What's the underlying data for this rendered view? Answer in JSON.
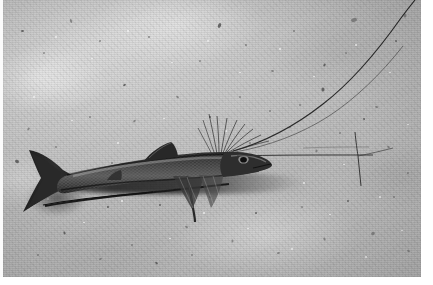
{
  "image": {
    "kind": "photograph",
    "medium": "black-and-white underwater photograph",
    "title": "Tripodfish resting on deep-sea sediment",
    "caption": "A slender tripodfish stands on the seafloor, propped on elongated pelvic and lower caudal fin rays, with long pectoral fin filaments trailing forward across the sediment.",
    "orientation": "landscape",
    "palette": {
      "sediment_light": "#d6d6d4",
      "sediment_mid": "#c2c2bf",
      "sediment_dark": "#a9a9a5",
      "fish_body": "#3a3a37",
      "fish_dark": "#1d1d1b",
      "shadow": "#2a2a28",
      "border": "#ffffff",
      "speck_dark": "#5a5a56",
      "speck_light": "#f2f2ef"
    },
    "subjects": [
      {
        "name": "tripodfish",
        "label": "Tripodfish (Bathypterois) on seabed",
        "position": "center-left, body horizontal"
      },
      {
        "name": "caudal-fin",
        "label": "Forked caudal fin",
        "position": "far left"
      },
      {
        "name": "caudal-filament",
        "label": "Elongated lower caudal fin ray acting as a strut",
        "position": "lower left, trailing right"
      },
      {
        "name": "dorsal-fin",
        "label": "Dorsal fin",
        "position": "upper mid-body"
      },
      {
        "name": "pelvic-strut",
        "label": "Elongated pelvic fin ray propping the body",
        "position": "beneath mid-body"
      },
      {
        "name": "pectoral-filaments",
        "label": "Long pectoral fin filaments fanning forward",
        "position": "from behind head, sweeping up and right"
      },
      {
        "name": "eye",
        "label": "Small dark eye",
        "position": "head, right of body"
      },
      {
        "name": "snout",
        "label": "Pointed snout",
        "position": "rightmost point of the fish"
      },
      {
        "name": "body-shadow",
        "label": "Shadow cast on the sediment",
        "position": "directly below the body"
      },
      {
        "name": "sediment",
        "label": "Fine pale seafloor sediment with scattered dark debris",
        "position": "full frame background"
      }
    ],
    "specks_dark": [
      [
        18,
        30,
        3,
        2
      ],
      [
        40,
        52,
        2,
        2
      ],
      [
        66,
        20,
        4,
        2
      ],
      [
        96,
        40,
        2,
        2
      ],
      [
        120,
        84,
        3,
        2
      ],
      [
        145,
        36,
        2,
        2
      ],
      [
        173,
        96,
        3,
        2
      ],
      [
        196,
        60,
        2,
        2
      ],
      [
        214,
        24,
        5,
        3
      ],
      [
        242,
        44,
        2,
        2
      ],
      [
        268,
        70,
        3,
        2
      ],
      [
        290,
        30,
        2,
        2
      ],
      [
        318,
        88,
        4,
        3
      ],
      [
        342,
        52,
        2,
        2
      ],
      [
        348,
        18,
        6,
        4
      ],
      [
        372,
        106,
        3,
        2
      ],
      [
        392,
        40,
        2,
        2
      ],
      [
        400,
        14,
        4,
        3
      ],
      [
        24,
        128,
        3,
        2
      ],
      [
        52,
        146,
        2,
        2
      ],
      [
        12,
        160,
        4,
        3
      ],
      [
        86,
        116,
        2,
        2
      ],
      [
        108,
        162,
        2,
        2
      ],
      [
        130,
        120,
        3,
        2
      ],
      [
        156,
        204,
        2,
        2
      ],
      [
        182,
        226,
        3,
        2
      ],
      [
        206,
        196,
        2,
        2
      ],
      [
        228,
        240,
        3,
        2
      ],
      [
        252,
        212,
        2,
        2
      ],
      [
        274,
        252,
        3,
        2
      ],
      [
        298,
        206,
        2,
        2
      ],
      [
        320,
        238,
        3,
        2
      ],
      [
        344,
        200,
        2,
        2
      ],
      [
        368,
        232,
        4,
        3
      ],
      [
        390,
        196,
        2,
        2
      ],
      [
        404,
        250,
        3,
        2
      ],
      [
        60,
        232,
        3,
        2
      ],
      [
        34,
        254,
        2,
        2
      ],
      [
        96,
        258,
        3,
        2
      ],
      [
        128,
        244,
        2,
        2
      ],
      [
        152,
        262,
        3,
        2
      ],
      [
        188,
        254,
        2,
        2
      ],
      [
        312,
        150,
        3,
        2
      ],
      [
        336,
        132,
        2,
        2
      ],
      [
        360,
        118,
        2,
        2
      ],
      [
        384,
        146,
        3,
        2
      ],
      [
        404,
        172,
        2,
        2
      ],
      [
        70,
        186,
        2,
        2
      ],
      [
        104,
        206,
        2,
        2
      ],
      [
        144,
        176,
        2,
        2
      ],
      [
        246,
        142,
        2,
        2
      ],
      [
        286,
        126,
        2,
        2
      ],
      [
        320,
        64,
        3,
        2
      ],
      [
        296,
        104,
        2,
        2
      ],
      [
        266,
        110,
        2,
        2
      ],
      [
        236,
        96,
        2,
        2
      ],
      [
        206,
        116,
        2,
        2
      ]
    ],
    "specks_light": [
      [
        52,
        36,
        2,
        2
      ],
      [
        88,
        58,
        2,
        1
      ],
      [
        124,
        30,
        2,
        2
      ],
      [
        168,
        62,
        2,
        1
      ],
      [
        204,
        40,
        2,
        2
      ],
      [
        236,
        72,
        2,
        1
      ],
      [
        276,
        48,
        2,
        2
      ],
      [
        310,
        76,
        2,
        1
      ],
      [
        352,
        44,
        2,
        2
      ],
      [
        386,
        72,
        2,
        1
      ],
      [
        30,
        96,
        2,
        2
      ],
      [
        68,
        120,
        2,
        1
      ],
      [
        114,
        142,
        2,
        2
      ],
      [
        160,
        118,
        2,
        1
      ],
      [
        222,
        130,
        2,
        2
      ],
      [
        258,
        158,
        2,
        1
      ],
      [
        300,
        182,
        2,
        2
      ],
      [
        340,
        164,
        2,
        1
      ],
      [
        376,
        196,
        2,
        2
      ],
      [
        404,
        124,
        2,
        1
      ],
      [
        44,
        198,
        2,
        2
      ],
      [
        80,
        222,
        2,
        1
      ],
      [
        118,
        200,
        2,
        2
      ],
      [
        166,
        238,
        2,
        1
      ],
      [
        200,
        212,
        2,
        2
      ],
      [
        244,
        228,
        2,
        1
      ],
      [
        288,
        248,
        2,
        2
      ],
      [
        326,
        214,
        2,
        1
      ],
      [
        362,
        256,
        2,
        2
      ],
      [
        398,
        230,
        2,
        1
      ]
    ]
  }
}
